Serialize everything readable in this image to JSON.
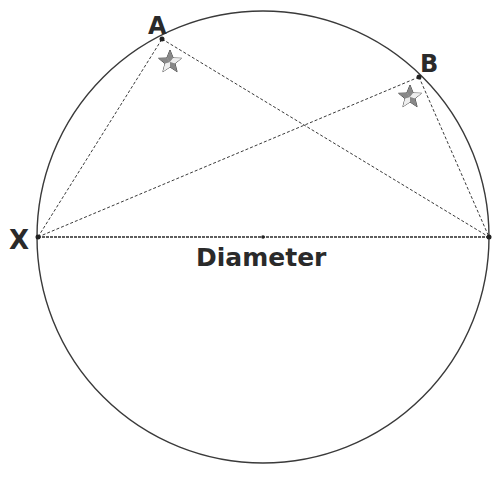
{
  "diagram": {
    "circle": {
      "cx": 263,
      "cy": 237,
      "r": 226,
      "stroke": "#3a3a3a"
    },
    "points": {
      "A": {
        "label": "A",
        "x": 162,
        "y": 39,
        "label_x": 148,
        "label_y": 34
      },
      "B": {
        "label": "B",
        "x": 419,
        "y": 77,
        "label_x": 420,
        "label_y": 72
      },
      "X": {
        "label": "X",
        "x": 38,
        "y": 237,
        "label_x": 9,
        "label_y": 249
      },
      "Y": {
        "label": "",
        "x": 489,
        "y": 237
      }
    },
    "center": {
      "x": 263,
      "y": 237
    },
    "diameter_label": "Diameter",
    "stars": [
      {
        "near": "A",
        "x": 170,
        "y": 62
      },
      {
        "near": "B",
        "x": 410,
        "y": 97
      }
    ],
    "colors": {
      "line": "#3a3a3a",
      "text": "#2a2a2a",
      "star_fill": "#9a9a9a"
    }
  }
}
